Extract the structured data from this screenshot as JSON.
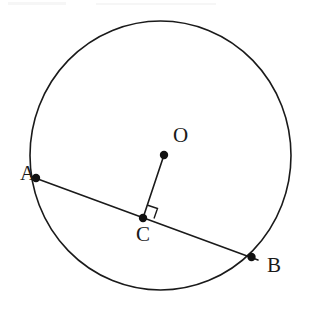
{
  "figure": {
    "background_color": "#ffffff",
    "stroke_color": "#1a1a1a",
    "width": 312,
    "height": 309
  },
  "labels": {
    "center": "O",
    "chord_start": "A",
    "chord_end": "B",
    "foot_of_perpendicular": "C"
  },
  "chart_data": {
    "type": "diagram",
    "subtype": "euclidean-geometry",
    "coordinate_system": "image pixels, origin top-left",
    "shapes": [
      {
        "name": "circle",
        "kind": "ellipse",
        "cx": 160.5,
        "cy": 155.5,
        "rx": 130.5,
        "ry": 134.5,
        "stroke": "#1a1a1a",
        "stroke_width": 1.6,
        "fill": "none"
      },
      {
        "name": "chord-AB",
        "kind": "segment",
        "from": "A",
        "to": "B",
        "x1": 31.0,
        "y1": 176.5,
        "x2": 258.0,
        "y2": 260.0,
        "stroke": "#1a1a1a",
        "stroke_width": 1.6
      },
      {
        "name": "segment-OC",
        "kind": "segment",
        "from": "O",
        "to": "C",
        "x1": 164.0,
        "y1": 155.0,
        "x2": 143.0,
        "y2": 218.0,
        "stroke": "#1a1a1a",
        "stroke_width": 1.6
      },
      {
        "name": "right-angle-marker",
        "kind": "polyline",
        "at": "C",
        "points": "147.0,205.0 157.5,208.5 154.0,218.5",
        "stroke": "#1a1a1a",
        "stroke_width": 1.4,
        "fill": "none",
        "meaning": "OC is perpendicular to AB at C"
      }
    ],
    "points": [
      {
        "name": "O",
        "x": 164.0,
        "y": 155.0,
        "label": "O",
        "label_x": 174.0,
        "label_y": 136.0,
        "marker": "filled-dot",
        "radius": 4.2,
        "role": "center of circle"
      },
      {
        "name": "A",
        "x": 36.0,
        "y": 178.0,
        "label": "A",
        "label_x": 21.0,
        "label_y": 174.0,
        "marker": "filled-dot",
        "radius": 4.2,
        "role": "chord endpoint on circle"
      },
      {
        "name": "B",
        "x": 251.5,
        "y": 257.0,
        "label": "B",
        "label_x": 268.0,
        "label_y": 266.0,
        "marker": "filled-dot",
        "radius": 4.2,
        "role": "chord endpoint on circle"
      },
      {
        "name": "C",
        "x": 143.0,
        "y": 218.0,
        "label": "C",
        "label_x": 137.0,
        "label_y": 235.0,
        "marker": "filled-dot",
        "radius": 4.2,
        "role": "midpoint of chord AB, foot of perpendicular from O"
      }
    ],
    "annotations": [
      "OC ⊥ AB at C",
      "A and B lie on the circle",
      "O is the center of the circle"
    ],
    "grid": false,
    "legend": null,
    "axes": null
  }
}
